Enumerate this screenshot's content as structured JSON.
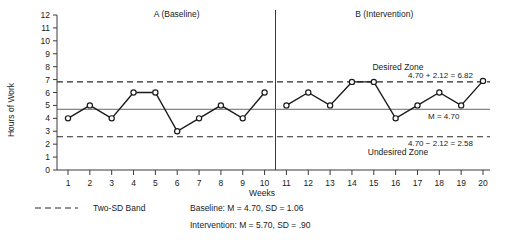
{
  "chart_data": {
    "type": "line",
    "title": "",
    "xlabel": "Weeks",
    "ylabel": "Hours of Work",
    "xlim": [
      0.4,
      20.6
    ],
    "ylim": [
      0,
      12
    ],
    "grid": false,
    "legend_position": "below-left",
    "x": [
      1,
      2,
      3,
      4,
      5,
      6,
      7,
      8,
      9,
      10,
      11,
      12,
      13,
      14,
      15,
      16,
      17,
      18,
      19,
      20
    ],
    "y_ticks": [
      "0",
      "1",
      "2",
      "3",
      "4",
      "5",
      "6",
      "7",
      "8",
      "9",
      "10",
      "11",
      "12"
    ],
    "x_ticks": [
      "1",
      "2",
      "3",
      "4",
      "5",
      "6",
      "7",
      "8",
      "9",
      "10",
      "11",
      "12",
      "13",
      "14",
      "15",
      "16",
      "17",
      "18",
      "19",
      "20"
    ],
    "series": [
      {
        "name": "A (Baseline)",
        "x": [
          1,
          2,
          3,
          4,
          5,
          6,
          7,
          8,
          9,
          10
        ],
        "values": [
          4,
          5,
          4,
          6,
          6,
          3,
          4,
          5,
          4,
          6
        ]
      },
      {
        "name": "B (Intervention)",
        "x": [
          11,
          12,
          13,
          14,
          15,
          16,
          17,
          18,
          19,
          20
        ],
        "values": [
          5,
          6,
          5,
          6.82,
          6.82,
          4,
          5,
          6,
          5,
          6.9
        ]
      }
    ],
    "reference_lines": [
      {
        "name": "mean",
        "value": 4.7,
        "style": "solid",
        "label": "M = 4.70"
      },
      {
        "name": "upper-two-sd",
        "value": 6.82,
        "style": "dashed",
        "label": "4.70 + 2.12 = 6.82"
      },
      {
        "name": "lower-two-sd",
        "value": 2.58,
        "style": "dashed",
        "label": "4.70 − 2.12 = 2.58"
      }
    ],
    "phase_divider_x": 10.5,
    "annotations": [
      {
        "name": "desired-zone",
        "text": "Desired Zone"
      },
      {
        "name": "undesired-zone",
        "text": "Undesired Zone"
      }
    ]
  },
  "phases": {
    "a_label": "A (Baseline)",
    "b_label": "B (Intervention)"
  },
  "axes": {
    "y_title": "Hours of Work",
    "x_title": "Weeks"
  },
  "annotations": {
    "desired_zone": "Desired Zone",
    "undesired_zone": "Undesired Zone",
    "upper_band": "4.70 + 2.12 = 6.82",
    "lower_band": "4.70 − 2.12 = 2.58",
    "mean": "M = 4.70"
  },
  "legend": {
    "band_label": "Two-SD Band",
    "baseline_stats": "Baseline: M = 4.70, SD = 1.06",
    "intervention_stats": "Intervention: M = 5.70, SD = .90"
  },
  "colors": {
    "ink": "#1a1a1a",
    "axis": "#3a3a3a",
    "mean_line": "#555555"
  }
}
